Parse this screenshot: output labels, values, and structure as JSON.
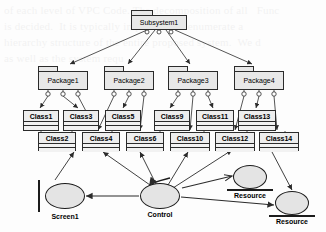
{
  "figure": {
    "type": "uml-architecture-diagram",
    "background_text": "of each level of VPC Code. The decomposition of all   Func\nis decided.  It is typically impossible to enumerate a\nhierarchy structure of the entire proposed system.  We d\nas well as the system requ"
  },
  "colors": {
    "shape_fill": "#e8e8e8",
    "class_fill": "#ededed",
    "stroke": "#2b2b2b",
    "ellipse_fill": "#e4e4e4",
    "ellipse_stroke": "#1c1c1c"
  },
  "subsystem": {
    "label": "Subsystem1",
    "x": 131,
    "y": 10,
    "w": 56,
    "h": 20,
    "tab_w": 22
  },
  "packages": [
    {
      "label": "Package1",
      "x": 38,
      "y": 66,
      "w": 50,
      "h": 24,
      "tab_w": 20
    },
    {
      "label": "Package2",
      "x": 104,
      "y": 66,
      "w": 50,
      "h": 24,
      "tab_w": 20
    },
    {
      "label": "Package3",
      "x": 168,
      "y": 66,
      "w": 50,
      "h": 24,
      "tab_w": 20
    },
    {
      "label": "Package4",
      "x": 234,
      "y": 66,
      "w": 50,
      "h": 24,
      "tab_w": 20
    }
  ],
  "classes": [
    {
      "label": "Class1",
      "x": 23,
      "y": 110,
      "w": 36,
      "h": 21
    },
    {
      "label": "Class3",
      "x": 63,
      "y": 110,
      "w": 36,
      "h": 21
    },
    {
      "label": "Class5",
      "x": 105,
      "y": 110,
      "w": 36,
      "h": 21
    },
    {
      "label": "Class7",
      "x": 145,
      "y": 110,
      "w": 36,
      "h": 21
    },
    {
      "label": "Class9",
      "x": 154,
      "y": 110,
      "w": 36,
      "h": 21
    },
    {
      "label": "Class11",
      "x": 196,
      "y": 110,
      "w": 38,
      "h": 21
    },
    {
      "label": "Class13",
      "x": 238,
      "y": 110,
      "w": 38,
      "h": 21
    },
    {
      "label": "Class2",
      "x": 38,
      "y": 132,
      "w": 38,
      "h": 19
    },
    {
      "label": "Class4",
      "x": 82,
      "y": 132,
      "w": 38,
      "h": 19
    },
    {
      "label": "Class6",
      "x": 126,
      "y": 132,
      "w": 38,
      "h": 19
    },
    {
      "label": "Class10",
      "x": 170,
      "y": 132,
      "w": 40,
      "h": 19
    },
    {
      "label": "Class12",
      "x": 215,
      "y": 132,
      "w": 40,
      "h": 19
    },
    {
      "label": "Class14",
      "x": 259,
      "y": 132,
      "w": 40,
      "h": 19
    }
  ],
  "boundary_objects": [
    {
      "label": "Screen1",
      "cx": 65,
      "cy": 196,
      "rx": 20,
      "ry": 13
    }
  ],
  "control_objects": [
    {
      "label": "Control",
      "cx": 160,
      "cy": 196,
      "rx": 20,
      "ry": 13
    }
  ],
  "entity_objects": [
    {
      "label": "Resource",
      "cx": 250,
      "cy": 177,
      "rx": 17,
      "ry": 12
    },
    {
      "label": "Resource",
      "cx": 292,
      "cy": 203,
      "rx": 17,
      "ry": 12
    }
  ],
  "connections": {
    "subsystem_to_packages": 4,
    "package_interface_balls_each": 3,
    "note": "packages decompose into classes; control object drives classes and resources"
  }
}
